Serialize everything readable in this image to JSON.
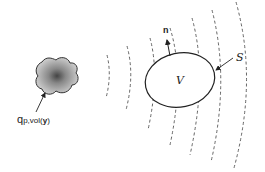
{
  "diagram": {
    "source_label": {
      "main": "q",
      "sub": "p,vol(",
      "bold": "y",
      "close": ")"
    },
    "volume_label": "V",
    "surface_label": "S",
    "normal_label": "n",
    "colors": {
      "stroke": "#222222",
      "blob_fill": "#b0b0b0",
      "blob_core": "#555555",
      "wave": "#555555"
    }
  }
}
